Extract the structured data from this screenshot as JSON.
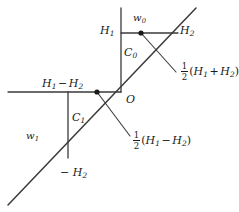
{
  "figure": {
    "background_color": "#ffffff",
    "stroke_color": "#3a3a3a",
    "text_color": "#1a1a1a"
  },
  "labels": {
    "h1": "H",
    "h1_sub": "1",
    "w0": "w",
    "w0_sub": "0",
    "h2_top": "H",
    "h2_top_sub": "2",
    "c0": "C",
    "c0_sub": "0",
    "origin": "O",
    "c1": "C",
    "c1_sub": "1",
    "w1": "w",
    "w1_sub": "1",
    "minus_h2": "− H",
    "minus_h2_sub": "2",
    "h1_minus_h2": {
      "first": "H",
      "first_sub": "1",
      "operator": "−",
      "second": "H",
      "second_sub": "2"
    },
    "half_sum": {
      "numerator": "1",
      "denominator": "2",
      "open": "(",
      "first": "H",
      "first_sub": "1",
      "operator": "+",
      "second": "H",
      "second_sub": "2",
      "close": ")"
    },
    "half_diff": {
      "numerator": "1",
      "denominator": "2",
      "open": "(",
      "first": "H",
      "first_sub": "1",
      "operator": "−",
      "second": "H",
      "second_sub": "2",
      "close": ")"
    }
  },
  "geometry": {
    "main_diagonal": {
      "x1": 8,
      "y1": 205,
      "x2": 196,
      "y2": 8
    },
    "top_horizontal": {
      "x1": 121,
      "y1": 33,
      "x2": 178,
      "y2": 33
    },
    "center_vertical": {
      "x1": 121,
      "y1": 8,
      "x2": 121,
      "y2": 92
    },
    "left_horizontal": {
      "x1": 8,
      "y1": 92,
      "x2": 121,
      "y2": 92
    },
    "left_vertical": {
      "x1": 68,
      "y1": 92,
      "x2": 68,
      "y2": 158
    },
    "leader_upper": {
      "x1": 141,
      "y1": 33,
      "x2": 176,
      "y2": 72
    },
    "leader_lower": {
      "x1": 97,
      "y1": 92,
      "x2": 130,
      "y2": 136
    },
    "dot_w0": {
      "cx": 141,
      "cy": 33,
      "r": 2.6
    },
    "dot_left": {
      "cx": 97,
      "cy": 92,
      "r": 2.6
    }
  }
}
